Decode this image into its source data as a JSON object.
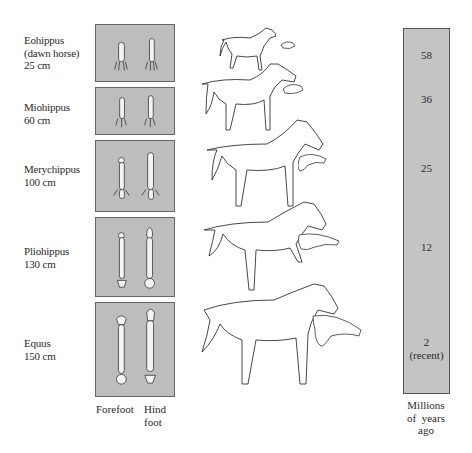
{
  "species": [
    {
      "name": "Eohippus",
      "note": "(dawn horse)",
      "height": "25 cm",
      "age": "58"
    },
    {
      "name": "Miohippus",
      "note": "",
      "height": "60 cm",
      "age": "36"
    },
    {
      "name": "Merychippus",
      "note": "",
      "height": "100 cm",
      "age": "25"
    },
    {
      "name": "Pliohippus",
      "note": "",
      "height": "130 cm",
      "age": "12"
    },
    {
      "name": "Equus",
      "note": "",
      "height": "150 cm",
      "age": "2",
      "age_note": "(recent)"
    }
  ],
  "foot_captions": {
    "forefoot": "Forefoot",
    "hindfoot_line1": "Hind",
    "hindfoot_line2": "foot"
  },
  "time_caption": {
    "line1": "Millions",
    "line2": "of  years",
    "line3": "ago"
  },
  "colors": {
    "panel": "#bdbdbd",
    "timebar": "#c4c4c4",
    "ink": "#2a2a2a"
  }
}
